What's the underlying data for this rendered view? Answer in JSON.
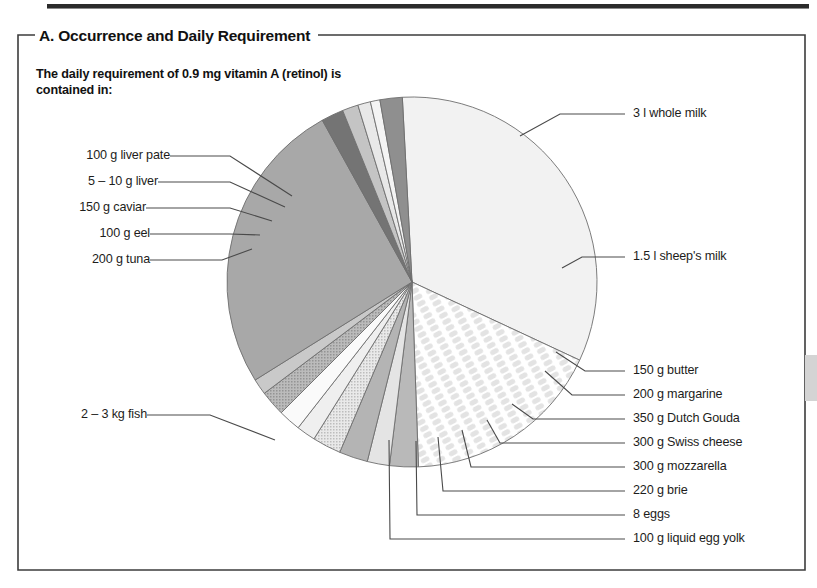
{
  "panel": {
    "title": "A. Occurrence and Daily Requirement",
    "subtitle": "The daily requirement of 0.9 mg vitamin A (retinol) is contained in:"
  },
  "chart_data": {
    "type": "pie",
    "title": "A. Occurrence and Daily Requirement",
    "subtitle": "The daily requirement of 0.9 mg vitamin A (retinol) is contained in:",
    "unit": "share of chart circle (degrees)",
    "legend": "none (direct leader-line labels)",
    "grid": false,
    "center": [
      412,
      282
    ],
    "radius": 185,
    "start_angle_deg": -93,
    "slices": [
      {
        "label": "3 l whole milk",
        "angle_deg": 118,
        "color": "#f2f2f2",
        "pattern": "solid"
      },
      {
        "label": "1.5 l sheep's milk",
        "angle_deg": 63,
        "color": "#fbfbfb",
        "pattern": "lattice"
      },
      {
        "label": "150 g butter",
        "angle_deg": 9,
        "color": "#b9b9b9",
        "pattern": "solid"
      },
      {
        "label": "200 g margarine",
        "angle_deg": 7,
        "color": "#e4e4e4",
        "pattern": "solid"
      },
      {
        "label": "350 g Dutch Gouda",
        "angle_deg": 9,
        "color": "#b4b4b4",
        "pattern": "solid"
      },
      {
        "label": "300 g Swiss cheese",
        "angle_deg": 9,
        "color": "#d8d8d8",
        "pattern": "dots"
      },
      {
        "label": "300 g mozzarella",
        "angle_deg": 6,
        "color": "#efefef",
        "pattern": "solid"
      },
      {
        "label": "220 g brie",
        "angle_deg": 7,
        "color": "#fafafa",
        "pattern": "solid"
      },
      {
        "label": "8 eggs",
        "angle_deg": 8,
        "color": "#a9a9a9",
        "pattern": "dots"
      },
      {
        "label": "100 g liquid egg yolk",
        "angle_deg": 5,
        "color": "#c9c9c9",
        "pattern": "solid"
      },
      {
        "label": "2 – 3 kg fish",
        "angle_deg": 93,
        "color": "#a8a8a8",
        "pattern": "solid"
      },
      {
        "label": "200 g tuna",
        "angle_deg": 7,
        "color": "#747474",
        "pattern": "solid"
      },
      {
        "label": "100 g eel",
        "angle_deg": 5,
        "color": "#c4c4c4",
        "pattern": "solid"
      },
      {
        "label": "150 g caviar",
        "angle_deg": 4,
        "color": "#e8e8e8",
        "pattern": "solid"
      },
      {
        "label": "5 – 10 g liver",
        "angle_deg": 3,
        "color": "#f4f4f4",
        "pattern": "solid"
      },
      {
        "label": "100 g liver pate",
        "angle_deg": 7,
        "color": "#8f8f8f",
        "pattern": "solid"
      }
    ]
  },
  "labels": {
    "left": [
      "100 g liver pate",
      "5 – 10 g liver",
      "150 g caviar",
      "100 g eel",
      "200 g tuna",
      "2 – 3 kg fish"
    ],
    "right": [
      "3 l whole milk",
      "1.5 l sheep's milk",
      "150 g butter",
      "200 g margarine",
      "350 g Dutch Gouda",
      "300 g Swiss cheese",
      "300 g mozzarella",
      "220 g brie",
      "8 eggs",
      "100 g liquid egg yolk"
    ]
  },
  "colors": {
    "frame": "#3c3c3c",
    "leader": "#4a4a4a",
    "slice_outline": "#6e6e6e",
    "text": "#1d1d1b",
    "top_rule": "#2b2b2b",
    "side_tab": "#d4d4d4"
  }
}
